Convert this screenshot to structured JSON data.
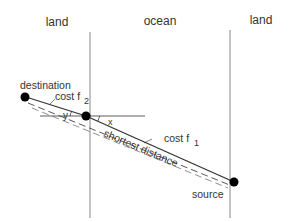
{
  "regions": {
    "left": "land",
    "middle": "ocean",
    "right": "land"
  },
  "points": {
    "destination": "destination",
    "source": "source"
  },
  "costs": {
    "f2": "cost f",
    "f2_sub": "2",
    "f1": "cost f",
    "f1_sub": "1"
  },
  "angles": {
    "y": "y",
    "x": "x"
  },
  "path_label": "shortest distance",
  "colors": {
    "line": "#333333",
    "boundary": "#888888",
    "point": "#000000"
  }
}
